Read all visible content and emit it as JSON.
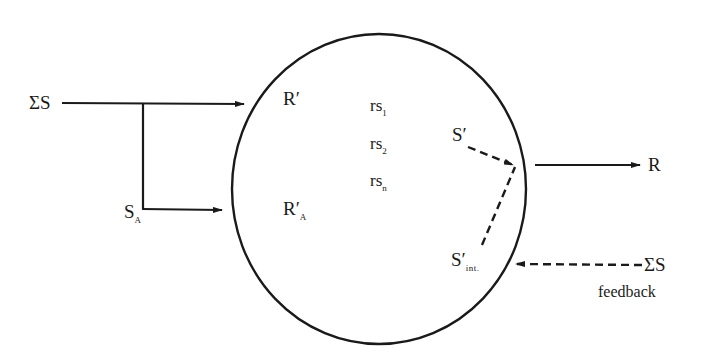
{
  "diagram": {
    "type": "stimulus-response organism model",
    "colors": {
      "stroke": "#1a1a1a",
      "background": "#ffffff"
    },
    "organism": {
      "shape": "ellipse"
    },
    "inputs": {
      "total_stimulus": {
        "symbol": "ΣS"
      },
      "selected_stimulus": {
        "symbol": "S",
        "subscript": "A"
      }
    },
    "internal": {
      "response_prime": {
        "symbol": "R′"
      },
      "response_prime_a": {
        "symbol": "R′",
        "subscript": "A"
      },
      "rs_items": [
        {
          "symbol": "rs",
          "subscript": "1"
        },
        {
          "symbol": "rs",
          "subscript": "2"
        },
        {
          "symbol": "rs",
          "subscript": "n"
        }
      ],
      "stimulus_prime": {
        "symbol": "S′"
      },
      "stimulus_prime_int": {
        "symbol": "S′",
        "subscript": "int."
      }
    },
    "outputs": {
      "response": {
        "symbol": "R"
      }
    },
    "feedback": {
      "symbol": "ΣS",
      "label": "feedback"
    }
  }
}
